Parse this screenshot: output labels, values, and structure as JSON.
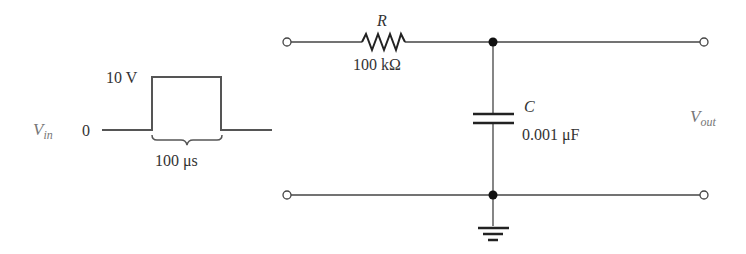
{
  "input_pulse": {
    "signal_label": "V",
    "signal_subscript": "in",
    "high_level": "10 V",
    "low_level": "0",
    "width_label": "100 μs"
  },
  "circuit": {
    "resistor": {
      "symbol": "R",
      "value": "100 kΩ"
    },
    "capacitor": {
      "symbol": "C",
      "value": "0.001 μF"
    },
    "output_label": "V",
    "output_subscript": "out"
  },
  "colors": {
    "wire": "#444444",
    "text": "#333333",
    "muted": "#777777"
  }
}
